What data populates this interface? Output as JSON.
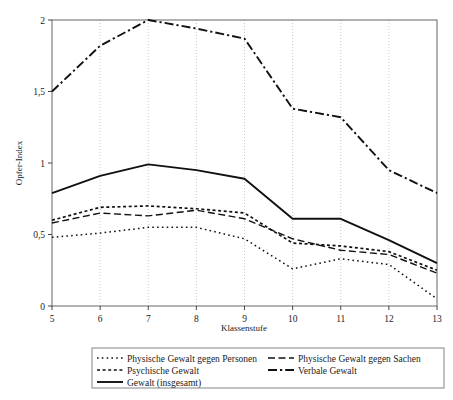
{
  "chart_data": {
    "type": "line",
    "title": "",
    "xlabel": "Klassenstufe",
    "ylabel": "Opfer-Index",
    "x": [
      5,
      6,
      7,
      8,
      9,
      10,
      11,
      12,
      13
    ],
    "xlim": [
      5,
      13
    ],
    "ylim": [
      0,
      2
    ],
    "xticks": [
      "5",
      "6",
      "7",
      "8",
      "9",
      "10",
      "11",
      "12",
      "13"
    ],
    "yticks": [
      "0",
      "0,5",
      "1",
      "1,5",
      "2"
    ],
    "ytick_values": [
      0,
      0.5,
      1,
      1.5,
      2
    ],
    "grid": "vertical-dotted",
    "legend_position": "bottom",
    "series": [
      {
        "name": "Physische Gewalt gegen Personen",
        "style": "dotted",
        "values": [
          0.48,
          0.51,
          0.55,
          0.55,
          0.47,
          0.26,
          0.33,
          0.29,
          0.05
        ]
      },
      {
        "name": "Physische Gewalt gegen Sachen",
        "style": "dashed-long",
        "values": [
          0.58,
          0.65,
          0.63,
          0.67,
          0.61,
          0.47,
          0.39,
          0.36,
          0.23
        ]
      },
      {
        "name": "Psychische Gewalt",
        "style": "dashed-short",
        "values": [
          0.6,
          0.69,
          0.7,
          0.68,
          0.65,
          0.44,
          0.42,
          0.38,
          0.25
        ]
      },
      {
        "name": "Verbale Gewalt",
        "style": "dash-dot",
        "values": [
          1.5,
          1.82,
          2.0,
          1.94,
          1.87,
          1.38,
          1.32,
          0.95,
          0.79
        ]
      },
      {
        "name": "Gewalt (insgesamt)",
        "style": "solid",
        "values": [
          0.79,
          0.91,
          0.99,
          0.95,
          0.89,
          0.61,
          0.61,
          0.46,
          0.3
        ]
      }
    ],
    "legend": [
      {
        "label": "Physische Gewalt gegen Personen",
        "style": "dotted",
        "col": 0,
        "row": 0
      },
      {
        "label": "Physische Gewalt gegen Sachen",
        "style": "dashed-long",
        "col": 1,
        "row": 0
      },
      {
        "label": "Psychische Gewalt",
        "style": "dashed-short",
        "col": 0,
        "row": 1
      },
      {
        "label": "Verbale Gewalt",
        "style": "dash-dot",
        "col": 1,
        "row": 1
      },
      {
        "label": "Gewalt (insgesamt)",
        "style": "solid",
        "col": 0,
        "row": 2
      }
    ],
    "colors": {
      "line": "#111111",
      "axis": "#555555",
      "grid": "#bbbbbb",
      "background": "#ffffff"
    }
  }
}
